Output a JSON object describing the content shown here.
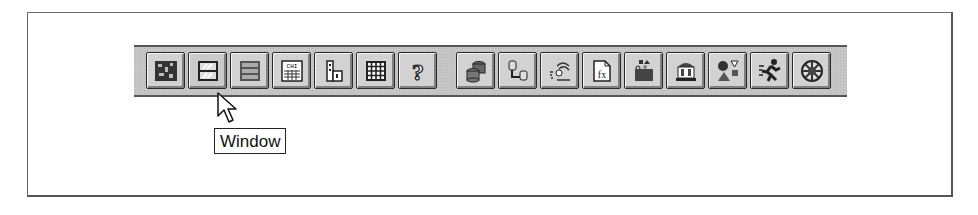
{
  "toolbar": {
    "groups": [
      {
        "buttons": [
          {
            "name": "circuit-board-button",
            "icon": "circuit-board-icon"
          },
          {
            "name": "window-button",
            "icon": "window-icon"
          },
          {
            "name": "file-cabinet-button",
            "icon": "file-cabinet-icon"
          },
          {
            "name": "chi-table-button",
            "icon": "chi-table-icon"
          },
          {
            "name": "factory-button",
            "icon": "factory-icon"
          },
          {
            "name": "grid-button",
            "icon": "grid-icon"
          },
          {
            "name": "help-button",
            "icon": "help-icon",
            "glyph": "?"
          }
        ]
      },
      {
        "buttons": [
          {
            "name": "databases-button",
            "icon": "databases-icon"
          },
          {
            "name": "database-link-button",
            "icon": "database-link-icon"
          },
          {
            "name": "hand-scatter-button",
            "icon": "hand-scatter-icon"
          },
          {
            "name": "function-document-button",
            "icon": "function-document-icon",
            "glyph": "fx"
          },
          {
            "name": "toolbox-button",
            "icon": "toolbox-icon"
          },
          {
            "name": "bank-button",
            "icon": "bank-icon"
          },
          {
            "name": "shapes-button",
            "icon": "shapes-icon"
          },
          {
            "name": "runner-button",
            "icon": "runner-icon"
          },
          {
            "name": "wheel-button",
            "icon": "wheel-icon"
          }
        ]
      }
    ]
  },
  "tooltip": {
    "text": "Window"
  },
  "colors": {
    "toolbar_bg": "#c6c6c6",
    "button_face": "#d2d2d2",
    "frame_border": "#6a6a6a"
  }
}
